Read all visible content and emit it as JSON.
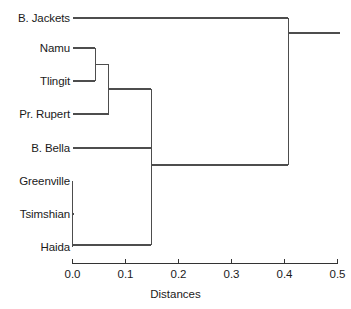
{
  "chart_data": {
    "type": "dendrogram",
    "title": "",
    "xlabel": "Distances",
    "ylabel": "",
    "xlim": [
      0.0,
      0.5
    ],
    "grid": false,
    "legend": "none",
    "orientation": "horizontal",
    "leaves": [
      {
        "label": "B. Jackets",
        "y": 18
      },
      {
        "label": "Namu",
        "y": 48
      },
      {
        "label": "Tlingit",
        "y": 81
      },
      {
        "label": "Pr. Rupert",
        "y": 114
      },
      {
        "label": "B. Bella",
        "y": 148
      },
      {
        "label": "Greenville",
        "y": 181
      },
      {
        "label": "Tsimshian",
        "y": 214
      },
      {
        "label": "Haida",
        "y": 247
      }
    ],
    "xticks": [
      0.0,
      0.1,
      0.2,
      0.3,
      0.4,
      0.5
    ],
    "xtick_labels": [
      "0.0",
      "0.1",
      "0.2",
      "0.3",
      "0.4",
      "0.5"
    ],
    "merges": [
      {
        "name": "Namu + Tlingit",
        "distance": 0.043,
        "members": [
          "Namu",
          "Tlingit"
        ],
        "height_y": 64.5
      },
      {
        "name": "(Namu,Tlingit) + Pr. Rupert",
        "distance": 0.068,
        "members": [
          "Namu",
          "Tlingit",
          "Pr. Rupert"
        ],
        "height_y": 89.0
      },
      {
        "name": "(Namu,Tlingit,Pr. Rupert) + B. Bella",
        "distance": 0.149,
        "members": [
          "Namu",
          "Tlingit",
          "Pr. Rupert",
          "B. Bella"
        ],
        "height_y": 133.0
      },
      {
        "name": "Greenville + Tsimshian + Haida",
        "distance": 0.0,
        "members": [
          "Greenville",
          "Tsimshian",
          "Haida"
        ],
        "height_y": 245.0
      },
      {
        "name": "North cluster + South cluster",
        "distance": 0.149,
        "members": [
          "Namu",
          "Tlingit",
          "Pr. Rupert",
          "B. Bella",
          "Greenville",
          "Tsimshian",
          "Haida"
        ],
        "height_y": 165.0
      },
      {
        "name": "All + B. Jackets",
        "distance": 0.407,
        "members": [
          "B. Jackets",
          "Namu",
          "Tlingit",
          "Pr. Rupert",
          "B. Bella",
          "Greenville",
          "Tsimshian",
          "Haida"
        ],
        "height_y": 33.0
      }
    ],
    "line_color": "#4d4d4d",
    "axis_color": "#333333",
    "background": "#ffffff"
  },
  "axis": {
    "title": "Distances",
    "tick_labels": [
      "0.0",
      "0.1",
      "0.2",
      "0.3",
      "0.4",
      "0.5"
    ]
  },
  "labels": {
    "b_jackets": "B. Jackets",
    "namu": "Namu",
    "tlingit": "Tlingit",
    "pr_rupert": "Pr. Rupert",
    "b_bella": "B. Bella",
    "greenville": "Greenville",
    "tsimshian": "Tsimshian",
    "haida": "Haida"
  }
}
